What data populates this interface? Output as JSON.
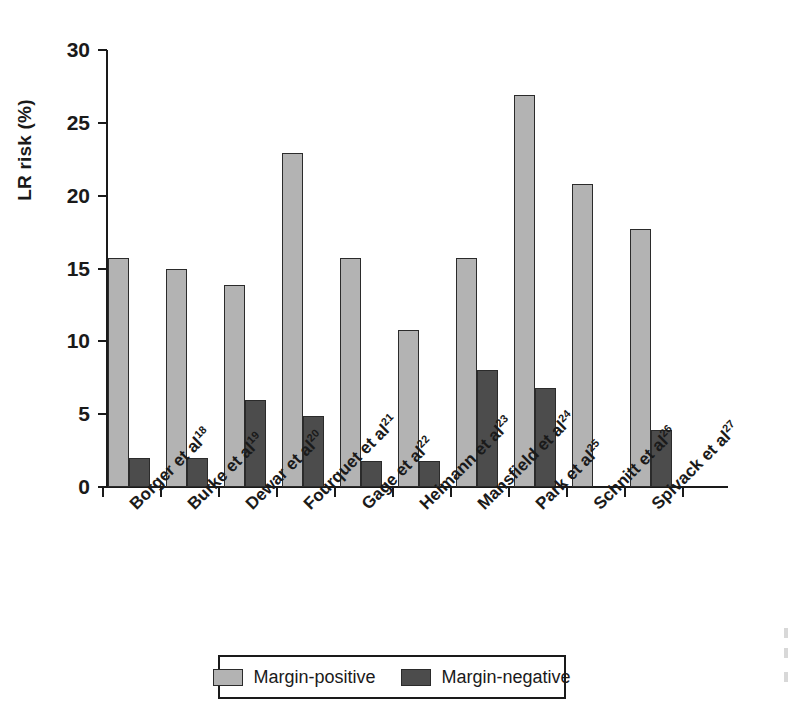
{
  "chart_data": {
    "type": "bar",
    "title": "",
    "xlabel": "",
    "ylabel": "LR risk (%)",
    "ylim": [
      0,
      30
    ],
    "yticks": [
      0,
      5,
      10,
      15,
      20,
      25,
      30
    ],
    "ytick_labels": [
      "0",
      "5",
      "10",
      "15",
      "20",
      "25",
      "30"
    ],
    "grid": false,
    "legend_position": "bottom",
    "categories": [
      "Borger et al",
      "Burke et al",
      "Dewar et al",
      "Fourquet et al",
      "Gage et al",
      "Heimann et al",
      "Mansfield et al",
      "Park et al",
      "Schnitt et al",
      "Spivack et al"
    ],
    "category_citations": [
      "18",
      "19",
      "20",
      "21",
      "22",
      "23",
      "24",
      "25",
      "26",
      "27"
    ],
    "series": [
      {
        "name": "Margin-positive",
        "color": "#b3b3b3",
        "values": [
          15.7,
          15.0,
          13.9,
          22.9,
          15.7,
          10.8,
          15.7,
          26.9,
          20.8,
          17.7
        ]
      },
      {
        "name": "Margin-negative",
        "color": "#4c4c4c",
        "values": [
          2.0,
          2.0,
          6.0,
          4.9,
          1.8,
          1.8,
          8.0,
          6.8,
          null,
          3.9
        ]
      }
    ]
  },
  "axis": {
    "y_title": "LR risk (%)"
  },
  "legend": {
    "items": [
      {
        "label": "Margin-positive",
        "swatch": "light-gray-swatch"
      },
      {
        "label": "Margin-negative",
        "swatch": "dark-gray-swatch"
      }
    ]
  }
}
